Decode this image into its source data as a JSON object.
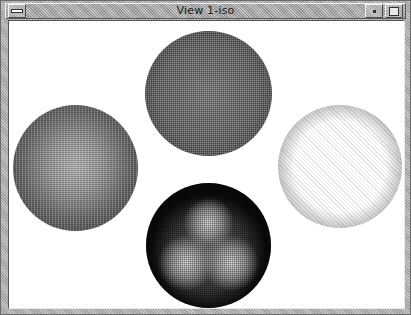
{
  "window": {
    "title": "View 1-iso",
    "buttons": {
      "menu": "window-menu",
      "minimize": "minimize",
      "maximize": "maximize"
    }
  },
  "viewport": {
    "background": "#ffffff",
    "spheres": [
      {
        "position": "top",
        "shading": "medium-grey-uniform"
      },
      {
        "position": "left",
        "shading": "dark-rim-square-core"
      },
      {
        "position": "right",
        "shading": "white-core-grey-rim"
      },
      {
        "position": "bottom",
        "shading": "black-three-lobe-highlight"
      }
    ]
  }
}
